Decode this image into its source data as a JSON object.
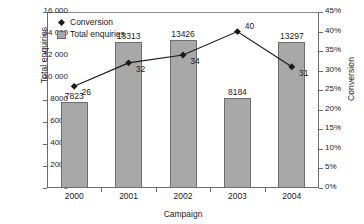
{
  "chart_data": {
    "type": "bar",
    "title": "",
    "xlabel": "Campaign",
    "ylabel": "Total enquiries",
    "y2label": "Conversion",
    "categories": [
      "2000",
      "2001",
      "2002",
      "2003",
      "2004"
    ],
    "ylim": [
      0,
      16000
    ],
    "y2lim": [
      0,
      45
    ],
    "grid": false,
    "legend_position": "top-left-inside",
    "series": [
      {
        "name": "Total enquiries",
        "type": "bar",
        "axis": "left",
        "color": "#a8a8a8",
        "values": [
          7823,
          13313,
          13426,
          8184,
          13297
        ],
        "labels": [
          "7823",
          "13313",
          "13426",
          "8184",
          "13297"
        ]
      },
      {
        "name": "Conversion",
        "type": "line",
        "axis": "right",
        "color": "#1a1a1a",
        "marker": "diamond",
        "values": [
          26,
          32,
          34,
          40,
          31
        ],
        "labels": [
          "26",
          "32",
          "34",
          "40",
          "31"
        ]
      }
    ],
    "yticks": [
      "0",
      "2000",
      "4000",
      "6000",
      "8000",
      "10 000",
      "12 000",
      "14 000",
      "16 000"
    ],
    "ytick_values": [
      0,
      2000,
      4000,
      6000,
      8000,
      10000,
      12000,
      14000,
      16000
    ],
    "y2ticks": [
      "0%",
      "5%",
      "10%",
      "15%",
      "20%",
      "25%",
      "30%",
      "35%",
      "40%",
      "45%"
    ],
    "y2tick_values": [
      0,
      5,
      10,
      15,
      20,
      25,
      30,
      35,
      40,
      45
    ]
  },
  "legend": {
    "items": [
      {
        "label": "Conversion",
        "marker": "diamond-marker-icon"
      },
      {
        "label": "Total enquiries",
        "marker": "square-swatch-icon"
      }
    ]
  }
}
